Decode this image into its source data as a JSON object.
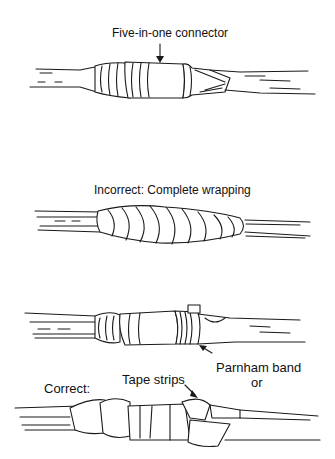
{
  "figures": [
    {
      "id": "connector",
      "label": "Five-in-one connector"
    },
    {
      "id": "incorrect",
      "label": "Incorrect: Complete wrapping"
    },
    {
      "id": "parnham",
      "label": "Parnham band",
      "label2": "or"
    },
    {
      "id": "correct",
      "label": "Correct:",
      "tape_label": "Tape strips"
    }
  ]
}
